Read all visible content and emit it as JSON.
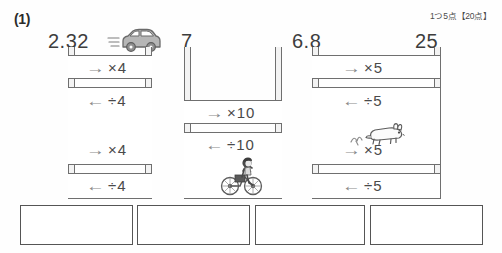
{
  "header": {
    "question_label": "(1)",
    "score_note": "1つ5点【20点】"
  },
  "top_numbers": [
    {
      "value": "2.32",
      "x": 48
    },
    {
      "value": "7",
      "x": 181
    },
    {
      "value": "6.8",
      "x": 292
    },
    {
      "value": "25",
      "x": 415
    }
  ],
  "columns": [
    {
      "name": "left",
      "operations": [
        {
          "label": "→×4",
          "arrow": "→",
          "expr": "×4",
          "direction": "right",
          "operator": "×",
          "operand": "4"
        },
        {
          "label": "←÷4",
          "arrow": "←",
          "expr": "÷4",
          "direction": "left",
          "operator": "÷",
          "operand": "4"
        },
        {
          "label": "→×4",
          "arrow": "→",
          "expr": "×4",
          "direction": "right",
          "operator": "×",
          "operand": "4"
        },
        {
          "label": "←÷4",
          "arrow": "←",
          "expr": "÷4",
          "direction": "left",
          "operator": "÷",
          "operand": "4"
        }
      ]
    },
    {
      "name": "middle",
      "operations": [
        {
          "label": "→×10",
          "arrow": "→",
          "expr": "×10",
          "direction": "right",
          "operator": "×",
          "operand": "10"
        },
        {
          "label": "←÷10",
          "arrow": "←",
          "expr": "÷10",
          "direction": "left",
          "operator": "÷",
          "operand": "10"
        }
      ]
    },
    {
      "name": "right",
      "operations": [
        {
          "label": "→×5",
          "arrow": "→",
          "expr": "×5",
          "direction": "right",
          "operator": "×",
          "operand": "5"
        },
        {
          "label": "←÷5",
          "arrow": "←",
          "expr": "÷5",
          "direction": "left",
          "operator": "÷",
          "operand": "5"
        },
        {
          "label": "→×5",
          "arrow": "→",
          "expr": "×5",
          "direction": "right",
          "operator": "×",
          "operand": "5"
        },
        {
          "label": "←÷5",
          "arrow": "←",
          "expr": "÷5",
          "direction": "left",
          "operator": "÷",
          "operand": "5"
        }
      ]
    }
  ],
  "illustrations": [
    {
      "name": "car-illustration",
      "alt": "car"
    },
    {
      "name": "bicycle-illustration",
      "alt": "child on bicycle"
    },
    {
      "name": "rabbit-illustration",
      "alt": "hopping rabbit"
    }
  ],
  "answer_boxes": [
    {
      "value": "",
      "index": 1
    },
    {
      "value": "",
      "index": 2
    },
    {
      "value": "",
      "index": 3
    },
    {
      "value": "",
      "index": 4
    }
  ]
}
